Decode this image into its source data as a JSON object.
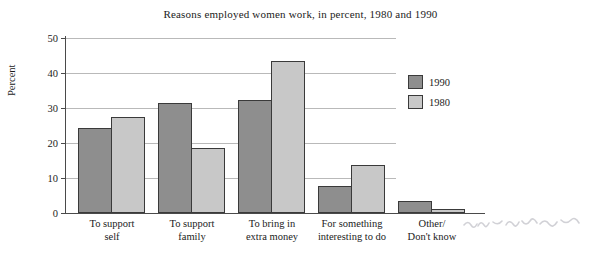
{
  "chart_data": {
    "type": "bar",
    "title": "Reasons employed women work, in percent, 1980 and 1990",
    "xlabel": "",
    "ylabel": "Percent",
    "ylim": [
      0,
      50
    ],
    "yticks": [
      0,
      10,
      20,
      30,
      40,
      50
    ],
    "grid": true,
    "legend_position": "right",
    "categories": [
      "To support\nself",
      "To support\nfamily",
      "To bring in\nextra money",
      "For something\ninteresting to do",
      "Other/\nDon't know"
    ],
    "categories_lines": [
      [
        "To support",
        "self"
      ],
      [
        "To support",
        "family"
      ],
      [
        "To bring in",
        "extra money"
      ],
      [
        "For something",
        "interesting to do"
      ],
      [
        "Other/",
        "Don't know"
      ]
    ],
    "series": [
      {
        "name": "1990",
        "color": "#8e8e8e",
        "values": [
          24,
          31,
          32,
          7.5,
          3.5
        ]
      },
      {
        "name": "1980",
        "color": "#c8c8c8",
        "values": [
          27,
          18.5,
          43,
          13.5,
          1
        ]
      }
    ]
  },
  "axis": {
    "tick_0": "0",
    "tick_10": "10",
    "tick_20": "20",
    "tick_30": "30",
    "tick_40": "40",
    "tick_50": "50"
  }
}
